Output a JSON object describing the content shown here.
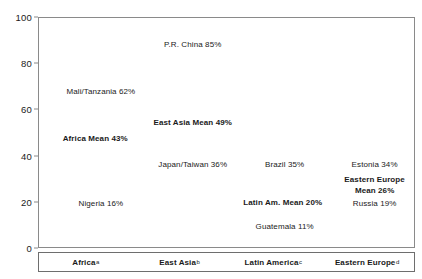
{
  "chart_data": {
    "type": "scatter",
    "title": "",
    "xlabel": "",
    "ylabel": "",
    "ylim": [
      0,
      100
    ],
    "yticks": [
      0,
      20,
      40,
      60,
      80,
      100
    ],
    "grid": false,
    "legend": false,
    "categories": [
      "Africa",
      "East Asia",
      "Latin America",
      "Eastern Europe"
    ],
    "category_footnotes": [
      "a",
      "b",
      "c",
      "d"
    ],
    "points": [
      {
        "label": "Mali/Tanzania 62%",
        "name": "Mali/Tanzania",
        "value": 62,
        "category": "Africa",
        "bold": false,
        "x_pct": 16.5,
        "y_val": 68
      },
      {
        "label": "Africa Mean 43%",
        "name": "Africa Mean",
        "value": 43,
        "category": "Africa",
        "bold": true,
        "x_pct": 15.0,
        "y_val": 47.5
      },
      {
        "label": "Nigeria 16%",
        "name": "Nigeria",
        "value": 16,
        "category": "Africa",
        "bold": false,
        "x_pct": 16.5,
        "y_val": 19.5
      },
      {
        "label": "P.R. China 85%",
        "name": "P.R. China",
        "value": 85,
        "category": "East Asia",
        "bold": false,
        "x_pct": 41.0,
        "y_val": 88.5
      },
      {
        "label": "East Asia Mean 49%",
        "name": "East Asia Mean",
        "value": 49,
        "category": "East Asia",
        "bold": true,
        "x_pct": 41.0,
        "y_val": 54.5
      },
      {
        "label": "Japan/Taiwan 36%",
        "name": "Japan/Taiwan",
        "value": 36,
        "category": "East Asia",
        "bold": false,
        "x_pct": 41.0,
        "y_val": 36.5
      },
      {
        "label": "Brazil 35%",
        "name": "Brazil",
        "value": 35,
        "category": "Latin America",
        "bold": false,
        "x_pct": 65.5,
        "y_val": 36.5
      },
      {
        "label": "Latin Am. Mean 20%",
        "name": "Latin Am. Mean",
        "value": 20,
        "category": "Latin America",
        "bold": true,
        "x_pct": 65.0,
        "y_val": 20.0
      },
      {
        "label": "Guatemala 11%",
        "name": "Guatemala",
        "value": 11,
        "category": "Latin America",
        "bold": false,
        "x_pct": 65.5,
        "y_val": 9.5
      },
      {
        "label": "Estonia 34%",
        "name": "Estonia",
        "value": 34,
        "category": "Eastern Europe",
        "bold": false,
        "x_pct": 89.5,
        "y_val": 36.5
      },
      {
        "label": "Eastern Europe Mean 26%",
        "name": "Eastern Europe Mean",
        "value": 26,
        "category": "Eastern Europe",
        "bold": true,
        "wrapped": true,
        "x_pct": 89.5,
        "y_val": 27.5
      },
      {
        "label": "Russia 19%",
        "name": "Russia",
        "value": 19,
        "category": "Eastern Europe",
        "bold": false,
        "x_pct": 89.5,
        "y_val": 19.5
      }
    ]
  },
  "colors": {
    "frame": "#8a8a8a",
    "band_border": "#6e6e6e",
    "text": "#1a1a1a",
    "background": "#ffffff"
  }
}
